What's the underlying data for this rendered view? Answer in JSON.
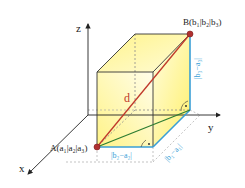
{
  "diagram": {
    "axes": {
      "x_label": "x",
      "y_label": "y",
      "z_label": "z"
    },
    "points": {
      "A": {
        "label": "A(a₁|a₂|a₃)",
        "name": "A",
        "sub": [
          "1",
          "2",
          "3"
        ],
        "letter": "a"
      },
      "B": {
        "label": "B(b₁|b₂|b₃)",
        "name": "B",
        "sub": [
          "1",
          "2",
          "3"
        ],
        "letter": "b"
      }
    },
    "distance_label": "d",
    "edge_labels": {
      "width": "|b₂−a₂|",
      "depth": "|b₁−a₁|",
      "height": "|b₃−a₃|"
    },
    "colors": {
      "diagonal": "#c0392b",
      "floor_diagonal": "#2e7d32",
      "edge_highlight": "#3a9fd6",
      "box_fill": "#fff59d",
      "box_edge": "#333333",
      "point": "#b03030",
      "dashed": "#999999"
    }
  }
}
